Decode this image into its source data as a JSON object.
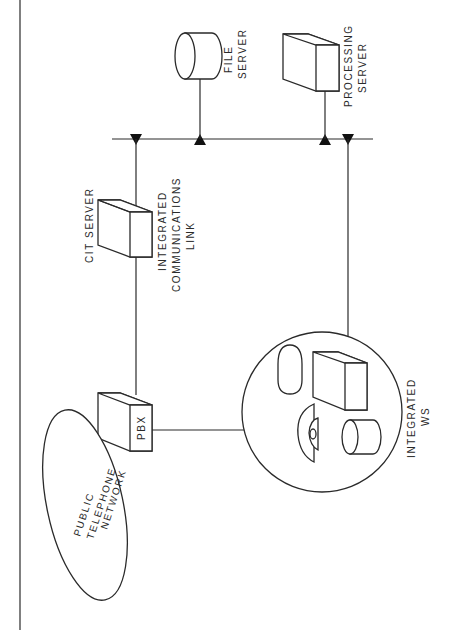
{
  "diagram": {
    "type": "network-architecture",
    "orientation": "rotated-90-ccw",
    "nodes": [
      {
        "id": "pstn",
        "label_lines": [
          "PUBLIC",
          "TELEPHONE",
          "NETWORK"
        ],
        "shape": "ellipse"
      },
      {
        "id": "pbx",
        "label_lines": [
          "PBX"
        ],
        "shape": "box"
      },
      {
        "id": "cit_server",
        "label_lines": [
          "CIT SERVER"
        ],
        "shape": "box"
      },
      {
        "id": "icl",
        "label_lines": [
          "INTEGRATED",
          "COMMUNICATIONS",
          "LINK"
        ],
        "shape": "label"
      },
      {
        "id": "file_server",
        "label_lines": [
          "FILE",
          "SERVER"
        ],
        "shape": "cylinder"
      },
      {
        "id": "processing_server",
        "label_lines": [
          "PROCESSING",
          "SERVER"
        ],
        "shape": "box"
      },
      {
        "id": "integrated_ws",
        "label_lines": [
          "INTEGRATED",
          "WS"
        ],
        "shape": "circle-group"
      }
    ],
    "edges": [
      {
        "from": "pbx",
        "to": "cit_server"
      },
      {
        "from": "cit_server",
        "to": "bus",
        "connector": "triangle-down"
      },
      {
        "from": "file_server",
        "to": "bus",
        "connector": "triangle-up"
      },
      {
        "from": "processing_server",
        "to": "bus",
        "connector": "triangle-up"
      },
      {
        "from": "integrated_ws",
        "to": "bus",
        "connector": "triangle-down"
      },
      {
        "from": "pbx",
        "to": "integrated_ws"
      }
    ],
    "labels": {
      "pstn": [
        "PUBLIC",
        "TELEPHONE",
        "NETWORK"
      ],
      "pbx": "PBX",
      "cit_server": "CIT SERVER",
      "icl": [
        "INTEGRATED",
        "COMMUNICATIONS",
        "LINK"
      ],
      "file_server": [
        "FILE",
        "SERVER"
      ],
      "processing_server": [
        "PROCESSING",
        "SERVER"
      ],
      "integrated_ws": [
        "INTEGRATED",
        "WS"
      ]
    },
    "colors": {
      "ink": "#2a2a2a",
      "background": "#ffffff"
    }
  }
}
